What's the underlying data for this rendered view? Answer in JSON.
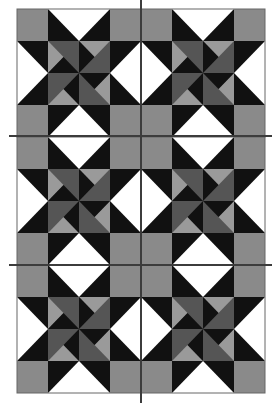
{
  "canvas": {
    "width": 279,
    "height": 407
  },
  "grid": {
    "x": 17,
    "y": 9,
    "block_width": 124,
    "block_height": 128,
    "cols": 2,
    "rows": 3,
    "units_per_block": 4
  },
  "colors": {
    "background": "#ffffff",
    "corner_gray": "#8a8a8a",
    "black": "#111111",
    "white": "#ffffff",
    "dark_gray": "#555555",
    "light_gray": "#9a9a9a",
    "border": "#666666",
    "guide_line": "#3c3c3c"
  },
  "guide_lines": {
    "vertical": [
      {
        "x": 141,
        "y1": 0,
        "y2": 403
      }
    ],
    "horizontal": [
      {
        "y": 136,
        "x1": 9,
        "x2": 272
      },
      {
        "y": 265,
        "x1": 9,
        "x2": 272
      }
    ]
  },
  "block": {
    "name": "Ohio star variation with pinwheel center",
    "corners": "corner_gray",
    "sides": "flying-geese white triangle pointing inward on black",
    "center": [
      {
        "pos": "top-left",
        "light_triangle": "left",
        "black_triangle": "bottom"
      },
      {
        "pos": "top-right",
        "light_triangle": "top",
        "black_triangle": "left"
      },
      {
        "pos": "bottom-left",
        "light_triangle": "bottom",
        "black_triangle": "right"
      },
      {
        "pos": "bottom-right",
        "light_triangle": "right",
        "black_triangle": "top"
      }
    ]
  }
}
